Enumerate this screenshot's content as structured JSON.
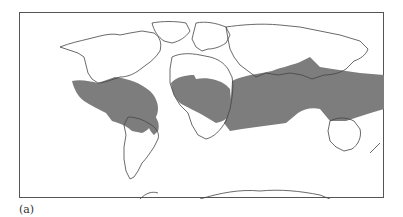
{
  "figure": {
    "label": "(a)",
    "type": "world-map",
    "shaded_region_color": "#7d7d7d",
    "coastline_color": "#444444",
    "background_color": "#ffffff",
    "shaded_regions": [
      "tropical-americas",
      "tropical-africa",
      "indian-ocean-to-western-pacific"
    ]
  }
}
